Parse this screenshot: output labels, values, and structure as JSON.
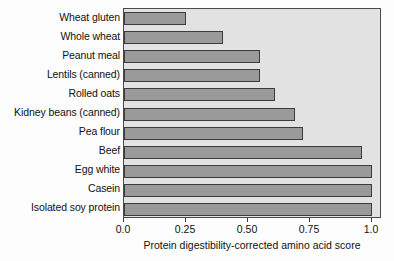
{
  "chart_data": {
    "type": "bar",
    "orientation": "horizontal",
    "title": "",
    "xlabel": "Protein digestibility-corrected amino acid score",
    "ylabel": "",
    "categories": [
      "Wheat gluten",
      "Whole wheat",
      "Peanut meal",
      "Lentils (canned)",
      "Rolled oats",
      "Kidney beans (canned)",
      "Pea flour",
      "Beef",
      "Egg white",
      "Casein",
      "Isolated soy protein"
    ],
    "values": [
      0.25,
      0.4,
      0.55,
      0.55,
      0.61,
      0.69,
      0.72,
      0.96,
      1.0,
      1.0,
      1.0
    ],
    "xlim": [
      0.0,
      1.04
    ],
    "xticks": [
      0.0,
      0.25,
      0.5,
      0.75,
      1.0
    ],
    "xtick_labels": [
      "0.0",
      "0.25",
      "0.50",
      "0.75",
      "1.0"
    ],
    "grid": false,
    "legend": null,
    "bar_color": "#9a9a9a",
    "bar_edge_color": "#3c3c3c",
    "plot_background": "#e2e2e2"
  }
}
